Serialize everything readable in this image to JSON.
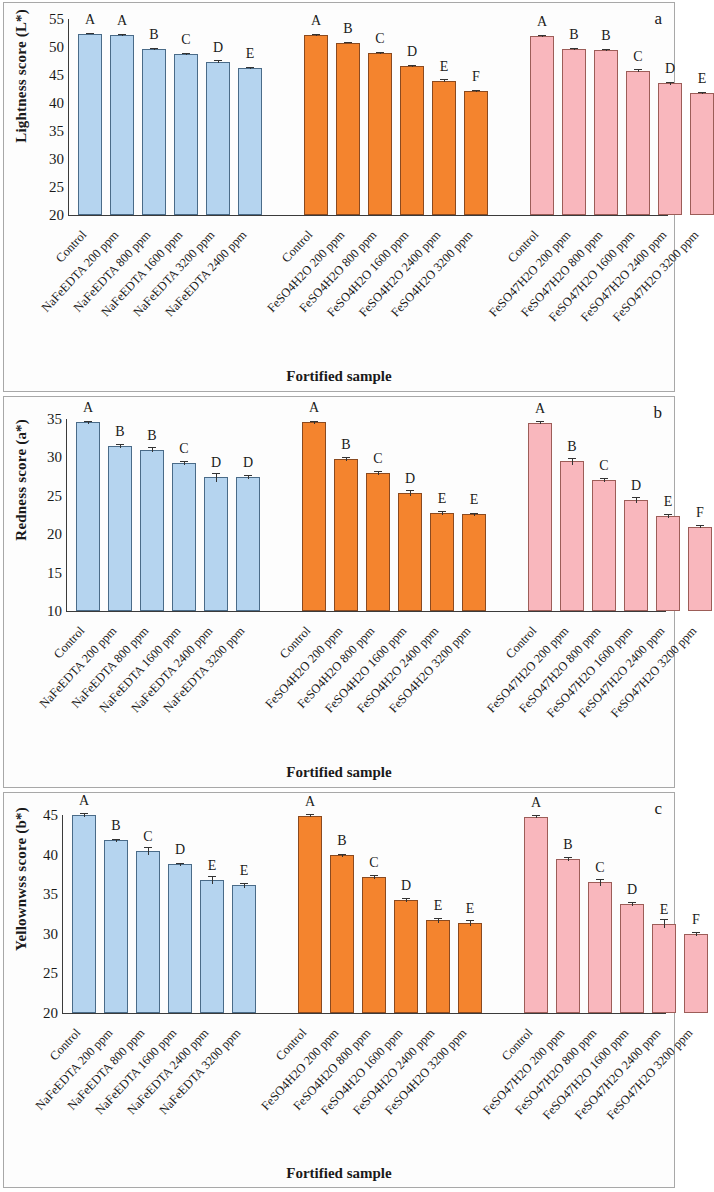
{
  "figure": {
    "xtitle": "Fortified sample",
    "panel_letters": [
      "a",
      "b",
      "c"
    ]
  },
  "chart_data": [
    {
      "type": "bar",
      "panel": "a",
      "title": "",
      "xlabel": "Fortified sample",
      "ylabel": "Lightness score (L*)",
      "ylim": [
        20,
        55
      ],
      "yticks": [
        20,
        25,
        30,
        35,
        40,
        45,
        50,
        55
      ],
      "grid": false,
      "legend": "none",
      "groups": [
        {
          "name": "NaFeEDTA",
          "color": "#b5d4ef",
          "categories": [
            "Control",
            "NaFeEDTA 200 ppm",
            "NaFeEDTA 800 ppm",
            "NaFeEDTA 1600 ppm",
            "NaFeEDTA 3200 ppm",
            "NaFeEDTA 2400 ppm"
          ],
          "values": [
            52.4,
            52.2,
            49.6,
            48.7,
            47.4,
            46.3
          ],
          "errors": [
            0.15,
            0.15,
            0.15,
            0.2,
            0.25,
            0.2
          ],
          "annotations": [
            "A",
            "A",
            "B",
            "C",
            "D",
            "E"
          ]
        },
        {
          "name": "FeSO4H2O",
          "color": "#f4842e",
          "categories": [
            "Control",
            "FeSO4H2O 200 ppm",
            "FeSO4H2O 800 ppm",
            "FeSO4H2O 1600 ppm",
            "FeSO4H2O 2400 ppm",
            "FeSO4H2O 3200 ppm"
          ],
          "values": [
            52.2,
            50.8,
            48.9,
            46.6,
            44.0,
            42.1
          ],
          "errors": [
            0.2,
            0.15,
            0.15,
            0.2,
            0.2,
            0.2
          ],
          "annotations": [
            "A",
            "B",
            "C",
            "D",
            "E",
            "F"
          ]
        },
        {
          "name": "FeSO47H2O",
          "color": "#f9b7bd",
          "categories": [
            "Control",
            "FeSO47H2O 200 ppm",
            "FeSO47H2O 800 ppm",
            "FeSO47H2O 1600 ppm",
            "FeSO47H2O 2400 ppm",
            "FeSO47H2O 3200 ppm"
          ],
          "values": [
            52.0,
            49.7,
            49.4,
            45.8,
            43.5,
            41.8
          ],
          "errors": [
            0.2,
            0.2,
            0.2,
            0.2,
            0.2,
            0.2
          ],
          "annotations": [
            "A",
            "B",
            "B",
            "C",
            "D",
            "E"
          ]
        }
      ]
    },
    {
      "type": "bar",
      "panel": "b",
      "title": "",
      "xlabel": "Fortified sample",
      "ylabel": "Redness score (a*)",
      "ylim": [
        10,
        35
      ],
      "yticks": [
        10,
        15,
        20,
        25,
        30,
        35
      ],
      "grid": false,
      "legend": "none",
      "groups": [
        {
          "name": "NaFeEDTA",
          "color": "#b5d4ef",
          "categories": [
            "Control",
            "NaFeEDTA 200 ppm",
            "NaFeEDTA 800 ppm",
            "NaFeEDTA 1600 ppm",
            "NaFeEDTA 2400 ppm",
            "NaFeEDTA 3200 ppm"
          ],
          "values": [
            34.6,
            31.5,
            31.0,
            29.3,
            27.4,
            27.4
          ],
          "errors": [
            0.2,
            0.25,
            0.3,
            0.25,
            0.6,
            0.25
          ],
          "annotations": [
            "A",
            "B",
            "B",
            "C",
            "D",
            "D"
          ]
        },
        {
          "name": "FeSO4H2O",
          "color": "#f4842e",
          "categories": [
            "Control",
            "FeSO4H2O 200 ppm",
            "FeSO4H2O 800 ppm",
            "FeSO4H2O 1600 ppm",
            "FeSO4H2O 2400 ppm",
            "FeSO4H2O 3200 ppm"
          ],
          "values": [
            34.6,
            29.8,
            28.0,
            25.4,
            22.8,
            22.6
          ],
          "errors": [
            0.2,
            0.25,
            0.25,
            0.4,
            0.25,
            0.2
          ],
          "annotations": [
            "A",
            "B",
            "C",
            "D",
            "E",
            "E"
          ]
        },
        {
          "name": "FeSO47H2O",
          "color": "#f9b7bd",
          "categories": [
            "Control",
            "FeSO47H2O 200 ppm",
            "FeSO47H2O 800 ppm",
            "FeSO47H2O 1600 ppm",
            "FeSO47H2O 2400 ppm",
            "FeSO47H2O 3200 ppm"
          ],
          "values": [
            34.5,
            29.5,
            27.1,
            24.4,
            22.4,
            21.0
          ],
          "errors": [
            0.2,
            0.45,
            0.25,
            0.4,
            0.25,
            0.25
          ],
          "annotations": [
            "A",
            "B",
            "C",
            "D",
            "E",
            "F"
          ]
        }
      ]
    },
    {
      "type": "bar",
      "panel": "c",
      "title": "",
      "xlabel": "Fortified sample",
      "ylabel": "Yellownwss score (b*)",
      "ylim": [
        20,
        45
      ],
      "yticks": [
        20,
        25,
        30,
        35,
        40,
        45
      ],
      "grid": false,
      "legend": "none",
      "groups": [
        {
          "name": "NaFeEDTA",
          "color": "#b5d4ef",
          "categories": [
            "Control",
            "NaFeEDTA 200 ppm",
            "NaFeEDTA 800 ppm",
            "NaFeEDTA 1600 ppm",
            "NaFeEDTA 2400 ppm",
            "NaFeEDTA 3200 ppm"
          ],
          "values": [
            45.0,
            41.8,
            40.5,
            38.8,
            36.8,
            36.1
          ],
          "errors": [
            0.2,
            0.2,
            0.5,
            0.2,
            0.45,
            0.3
          ],
          "annotations": [
            "A",
            "B",
            "C",
            "D",
            "E",
            "E"
          ]
        },
        {
          "name": "FeSO4H2O",
          "color": "#f4842e",
          "categories": [
            "Control",
            "FeSO4H2O 200 ppm",
            "FeSO4H2O 800 ppm",
            "FeSO4H2O 1600 ppm",
            "FeSO4H2O 2400 ppm",
            "FeSO4H2O 3200 ppm"
          ],
          "values": [
            44.9,
            39.9,
            37.2,
            34.3,
            31.7,
            31.4
          ],
          "errors": [
            0.2,
            0.2,
            0.25,
            0.25,
            0.3,
            0.4
          ],
          "annotations": [
            "A",
            "B",
            "C",
            "D",
            "E",
            "E"
          ]
        },
        {
          "name": "FeSO47H2O",
          "color": "#f9b7bd",
          "categories": [
            "Control",
            "FeSO47H2O 200 ppm",
            "FeSO47H2O 800 ppm",
            "FeSO47H2O 1600 ppm",
            "FeSO47H2O 2400 ppm",
            "FeSO47H2O 3200 ppm"
          ],
          "values": [
            44.8,
            39.4,
            36.5,
            33.8,
            31.3,
            30.0
          ],
          "errors": [
            0.2,
            0.25,
            0.45,
            0.25,
            0.6,
            0.25
          ],
          "annotations": [
            "A",
            "B",
            "C",
            "D",
            "E",
            "F"
          ]
        }
      ]
    }
  ]
}
